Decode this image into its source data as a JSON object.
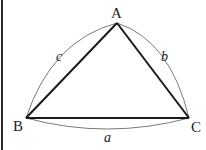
{
  "diagram": {
    "vertices": [
      {
        "id": "A",
        "label": "A",
        "x": 117,
        "y": 23
      },
      {
        "id": "B",
        "label": "B",
        "x": 26,
        "y": 118
      },
      {
        "id": "C",
        "label": "C",
        "x": 189,
        "y": 118
      }
    ],
    "sides": [
      {
        "id": "a",
        "label": "a",
        "from": "B",
        "to": "C"
      },
      {
        "id": "b",
        "label": "b",
        "from": "A",
        "to": "C"
      },
      {
        "id": "c",
        "label": "c",
        "from": "A",
        "to": "B"
      }
    ],
    "colors": {
      "straight_edge": "#1a1a1a",
      "arc_edge": "#7a7a7a",
      "text": "#222222",
      "border": "#2a2a2a"
    }
  }
}
